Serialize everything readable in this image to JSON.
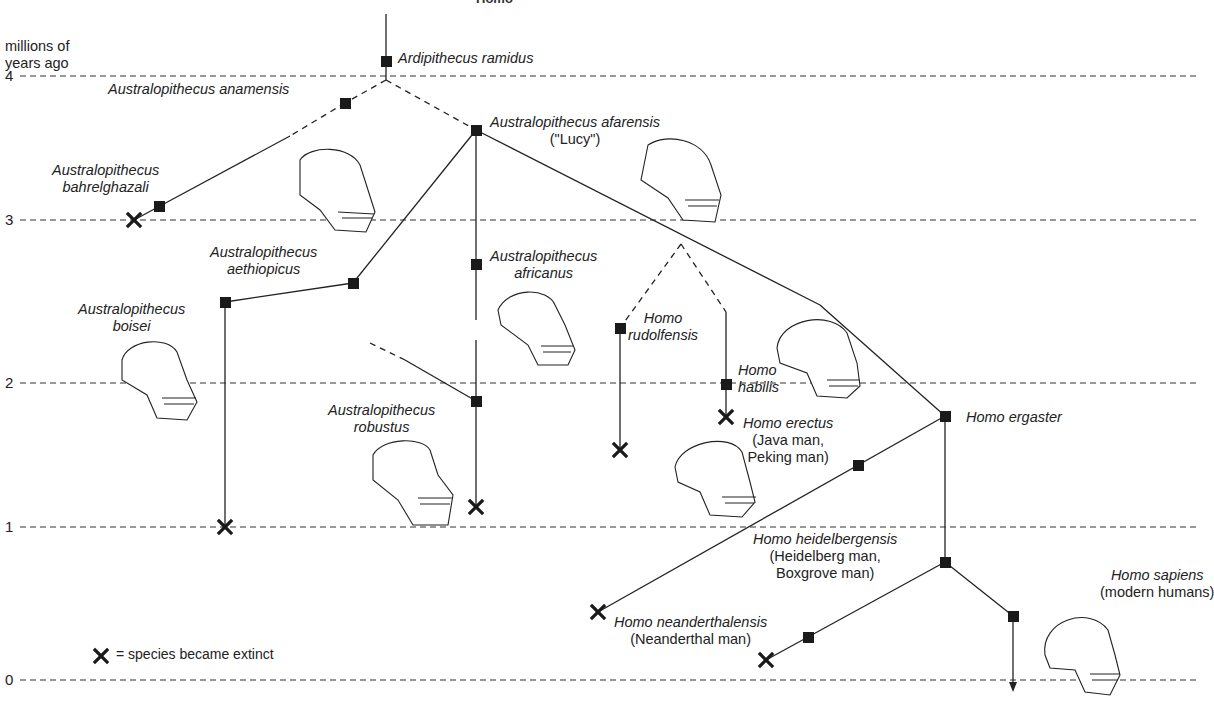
{
  "header": {
    "cut_title": "Homo"
  },
  "axis": {
    "title_line1": "millions of",
    "title_line2": "years ago",
    "ticks": [
      {
        "label": "4",
        "y": 76
      },
      {
        "label": "3",
        "y": 220
      },
      {
        "label": "2",
        "y": 383
      },
      {
        "label": "1",
        "y": 527
      },
      {
        "label": "0",
        "y": 680
      }
    ]
  },
  "legend": {
    "symbol": "✕",
    "text": "= species became extinct"
  },
  "species": {
    "ramidus": {
      "name": "Ardipithecus ramidus"
    },
    "anamensis": {
      "name": "Australopithecus anamensis"
    },
    "afarensis": {
      "name": "Australopithecus afarensis",
      "common": "(\"Lucy\")"
    },
    "bahrel": {
      "name1": "Australopithecus",
      "name2": "bahrelghazali"
    },
    "aethiopicus": {
      "name1": "Australopithecus",
      "name2": "aethiopicus"
    },
    "boisei": {
      "name1": "Australopithecus",
      "name2": "boisei"
    },
    "africanus": {
      "name1": "Australopithecus",
      "name2": "africanus"
    },
    "robustus": {
      "name1": "Australopithecus",
      "name2": "robustus"
    },
    "rudolfensis": {
      "name1": "Homo",
      "name2": "rudolfensis"
    },
    "habilis": {
      "name1": "Homo",
      "name2": "habilis"
    },
    "ergaster": {
      "name": "Homo ergaster"
    },
    "erectus": {
      "name": "Homo erectus",
      "common1": "(Java man,",
      "common2": "Peking man)"
    },
    "heidelbergensis": {
      "name": "Homo heidelbergensis",
      "common1": "(Heidelberg man,",
      "common2": "Boxgrove man)"
    },
    "sapiens": {
      "name": "Homo sapiens",
      "common": "(modern humans)"
    },
    "neanderthalensis": {
      "name": "Homo neanderthalensis",
      "common": "(Neanderthal man)"
    }
  }
}
